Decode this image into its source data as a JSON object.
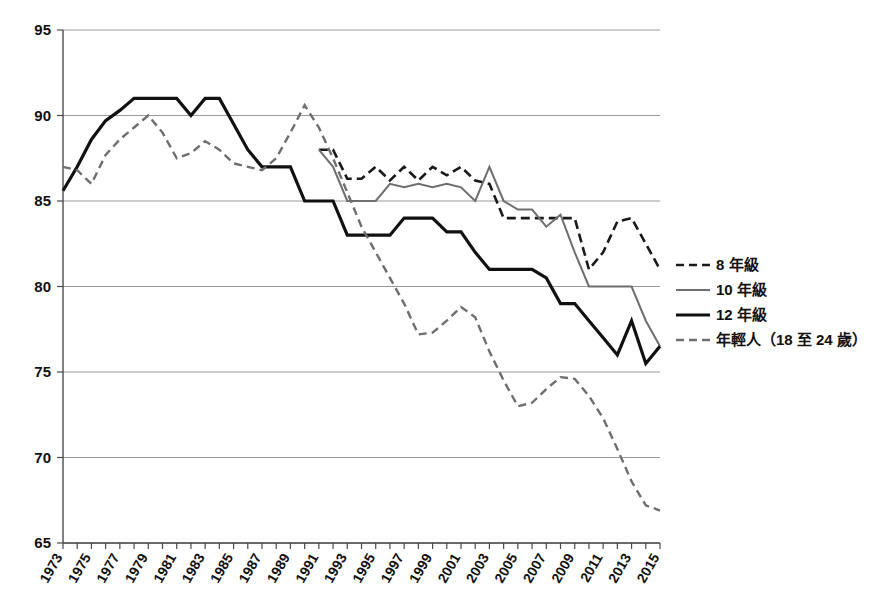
{
  "chart_data": {
    "type": "line",
    "title": "",
    "subtitle": "",
    "xlabel": "",
    "ylabel": "",
    "xlim": [
      1973,
      2015
    ],
    "ylim": [
      65,
      95
    ],
    "yticks": [
      65,
      70,
      75,
      80,
      85,
      90,
      95
    ],
    "ytick_labels": [
      "65",
      "70",
      "75",
      "80",
      "85",
      "90",
      "95"
    ],
    "grid": true,
    "grid_axis": "y",
    "legend_position": "right",
    "x": [
      1973,
      1974,
      1975,
      1976,
      1977,
      1978,
      1979,
      1980,
      1981,
      1982,
      1983,
      1984,
      1985,
      1986,
      1987,
      1988,
      1989,
      1990,
      1991,
      1992,
      1993,
      1994,
      1995,
      1996,
      1997,
      1998,
      1999,
      2000,
      2001,
      2002,
      2003,
      2004,
      2005,
      2006,
      2007,
      2008,
      2009,
      2010,
      2011,
      2012,
      2013,
      2014,
      2015
    ],
    "xtick_labels": [
      "1973",
      "1975",
      "1977",
      "1979",
      "1981",
      "1983",
      "1985",
      "1987",
      "1989",
      "1991",
      "1993",
      "1995",
      "1997",
      "1999",
      "2001",
      "2003",
      "2005",
      "2007",
      "2009",
      "2011",
      "2013",
      "2015"
    ],
    "xtick_label_years": [
      1973,
      1975,
      1977,
      1979,
      1981,
      1983,
      1985,
      1987,
      1989,
      1991,
      1993,
      1995,
      1997,
      1999,
      2001,
      2003,
      2005,
      2007,
      2009,
      2011,
      2013,
      2015
    ],
    "series": [
      {
        "name": "8 年級",
        "style": "dashed",
        "color": "#1a1a1a",
        "width": 2.6,
        "start_year": 1991,
        "values": [
          null,
          null,
          null,
          null,
          null,
          null,
          null,
          null,
          null,
          null,
          null,
          null,
          null,
          null,
          null,
          null,
          null,
          null,
          88,
          88,
          86.3,
          86.3,
          87,
          86.2,
          87,
          86.2,
          87,
          86.5,
          87,
          86.2,
          86,
          84,
          84,
          84,
          84,
          84,
          84,
          81,
          82,
          83.8,
          84,
          82.5,
          81
        ]
      },
      {
        "name": "10 年級",
        "style": "solid",
        "color": "#6e6e6e",
        "width": 2.0,
        "start_year": 1991,
        "values": [
          null,
          null,
          null,
          null,
          null,
          null,
          null,
          null,
          null,
          null,
          null,
          null,
          null,
          null,
          null,
          null,
          null,
          null,
          88,
          87,
          85,
          85,
          85,
          86,
          85.8,
          86,
          85.8,
          86,
          85.8,
          85,
          87,
          85,
          84.5,
          84.5,
          83.5,
          84.2,
          82,
          80,
          80,
          80,
          80,
          78,
          76.5
        ]
      },
      {
        "name": "12 年級",
        "style": "solid",
        "color": "#111111",
        "width": 3.2,
        "start_year": 1973,
        "values": [
          85.6,
          87,
          88.6,
          89.7,
          90.3,
          91,
          91,
          91,
          91,
          90,
          91,
          91,
          89.5,
          88,
          87,
          87,
          87,
          85,
          85,
          85,
          83,
          83,
          83,
          83,
          84,
          84,
          84,
          83.2,
          83.2,
          82,
          81,
          81,
          81,
          81,
          80.5,
          79,
          79,
          78,
          77,
          76,
          78,
          75.5,
          76.5
        ]
      },
      {
        "name": "年輕人（18 至 24 歲）",
        "style": "dashed",
        "color": "#6e6e6e",
        "width": 2.4,
        "start_year": 1973,
        "values": [
          87,
          86.8,
          86,
          87.7,
          88.6,
          89.3,
          90,
          89,
          87.5,
          87.8,
          88.5,
          88,
          87.2,
          87,
          86.8,
          87.5,
          89,
          90.6,
          89.3,
          87.5,
          85.5,
          83.5,
          82,
          80.5,
          79,
          77.2,
          77.3,
          78,
          78.8,
          78.2,
          76.2,
          74.5,
          73,
          73.2,
          74,
          74.7,
          74.6,
          73.6,
          72.3,
          70.5,
          68.6,
          67.2,
          66.9
        ]
      }
    ],
    "annotations": []
  },
  "legend": {
    "items": [
      {
        "label": "8 年級",
        "style": "dashed",
        "color": "#1a1a1a"
      },
      {
        "label": "10 年級",
        "style": "solid",
        "color": "#6e6e6e"
      },
      {
        "label": "12 年級",
        "style": "solid",
        "color": "#111111"
      },
      {
        "label": "年輕人（18 至 24 歲）",
        "style": "dashed",
        "color": "#6e6e6e"
      }
    ]
  },
  "colors": {
    "background": "#ffffff",
    "grid": "#9a9a9a",
    "axis": "#4a4a4a",
    "text": "#111111"
  }
}
